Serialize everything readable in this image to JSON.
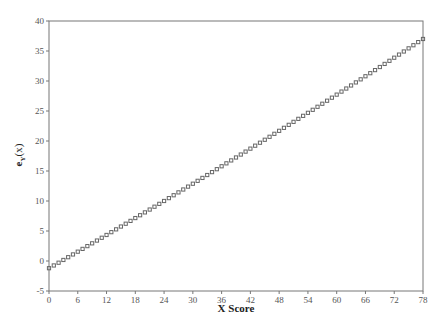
{
  "chart_data": {
    "type": "scatter",
    "title": "",
    "xlabel": "X Score",
    "ylabel": "e_Y(x)",
    "xlim": [
      0,
      78
    ],
    "ylim": [
      -5,
      40
    ],
    "xticks": [
      0,
      6,
      12,
      18,
      24,
      30,
      36,
      42,
      48,
      54,
      60,
      66,
      72,
      78
    ],
    "yticks": [
      -5,
      0,
      5,
      10,
      15,
      20,
      25,
      30,
      35,
      40
    ],
    "grid": false,
    "legend": null,
    "marker": "open-square",
    "marker_color": "#666666",
    "series": [
      {
        "name": "e_Y(x)",
        "x_start": 0,
        "x_end": 78,
        "x_step": 1,
        "model": "y = -1.2 + 0.4565x + 0.000427x^2",
        "sample_points": [
          [
            0,
            -1.2
          ],
          [
            6,
            1.5
          ],
          [
            12,
            4.3
          ],
          [
            18,
            7.1
          ],
          [
            24,
            9.9
          ],
          [
            30,
            12.9
          ],
          [
            36,
            15.8
          ],
          [
            42,
            18.7
          ],
          [
            48,
            21.7
          ],
          [
            54,
            24.7
          ],
          [
            60,
            27.7
          ],
          [
            66,
            30.8
          ],
          [
            72,
            33.9
          ],
          [
            78,
            37.0
          ]
        ]
      }
    ]
  }
}
